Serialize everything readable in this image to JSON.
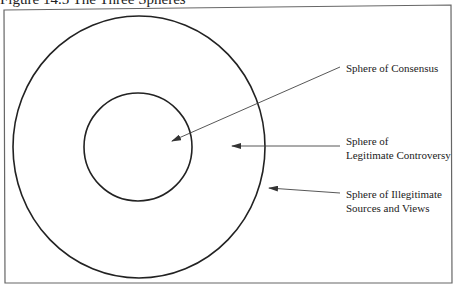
{
  "figure": {
    "caption": "Figure 14.5   The Three Spheres"
  },
  "diagram": {
    "spheres": [
      {
        "id": "consensus",
        "label_lines": [
          "Sphere of Consensus"
        ]
      },
      {
        "id": "legitimate-controversy",
        "label_lines": [
          "Sphere of",
          "Legitimate Controversy"
        ]
      },
      {
        "id": "illegitimate",
        "label_lines": [
          "Sphere of Illegitimate",
          "Sources and Views"
        ]
      }
    ],
    "colors": {
      "line": "#222222",
      "frame": "#555555",
      "arrow": "#444444"
    }
  }
}
